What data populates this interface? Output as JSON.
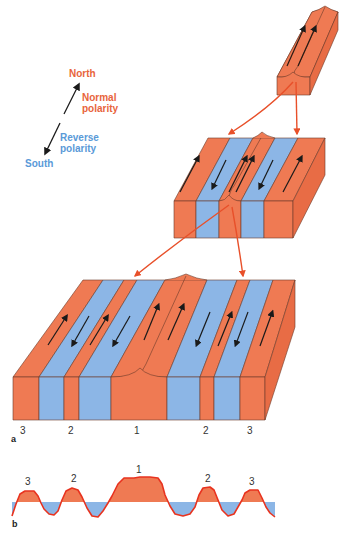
{
  "legend": {
    "north": "North",
    "normal_line1": "Normal",
    "normal_line2": "polarity",
    "reverse_line1": "Reverse",
    "reverse_line2": "polarity",
    "south": "South"
  },
  "panels": {
    "a": "a",
    "b": "b"
  },
  "block_labels": [
    "3",
    "2",
    "1",
    "2",
    "3"
  ],
  "profile_labels": [
    "3",
    "2",
    "1",
    "2",
    "3"
  ],
  "colors": {
    "normal": "#ef7a53",
    "reverse": "#8cb6e6",
    "outline": "#5a3a30",
    "arrow_connector": "#e8502a",
    "profile_line": "#e8331f",
    "north_text": "#e8643c",
    "south_text": "#5a9ad8"
  }
}
